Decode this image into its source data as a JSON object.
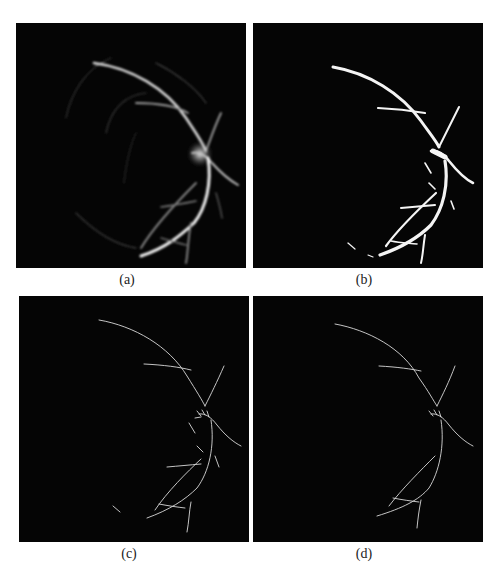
{
  "figure": {
    "panels": [
      {
        "id": "a",
        "caption": "(a)",
        "description": "Vessel probability map (grayscale, soft vessels with optic disc glow)"
      },
      {
        "id": "b",
        "caption": "(b)",
        "description": "Binary vessel segmentation (thick white vessels)"
      },
      {
        "id": "c",
        "caption": "(c)",
        "description": "Skeletonized vessels with spurs"
      },
      {
        "id": "d",
        "caption": "(d)",
        "description": "Pruned vessel skeleton"
      }
    ],
    "colors": {
      "background": "#ffffff",
      "panel_bg": "#050505",
      "vessel": "#f2f2f2"
    }
  }
}
